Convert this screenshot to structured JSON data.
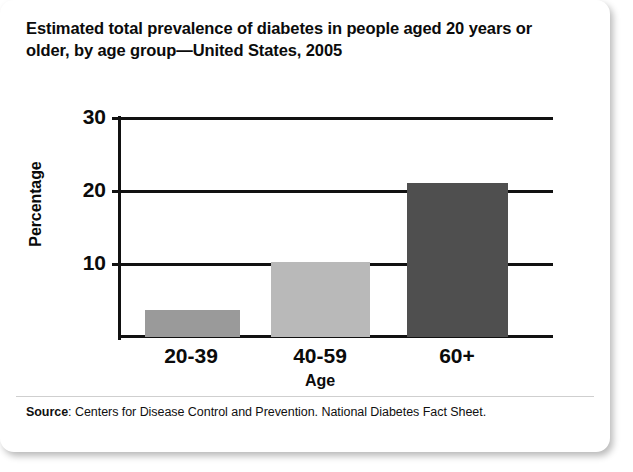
{
  "figure": {
    "title": "Estimated total prevalence of diabetes in people aged 20 years or older, by age group—United States, 2005",
    "source_label": "Source",
    "source_text": ": Centers for Disease Control and Prevention. National Diabetes Fact Sheet."
  },
  "chart_data": {
    "type": "bar",
    "title": "Estimated total prevalence of diabetes in people aged 20 years or older, by age group—United States, 2005",
    "categories": [
      "20-39",
      "40-59",
      "60+"
    ],
    "values": [
      3.6,
      10.1,
      20.6
    ],
    "series": [
      {
        "name": "Estimated total prevalence of diabetes",
        "values": [
          3.6,
          10.1,
          20.6
        ]
      }
    ],
    "xlabel": "Age",
    "ylabel": "Percentage",
    "ylim": [
      0,
      30
    ],
    "yticks": [
      10,
      20,
      30
    ],
    "ytick_labels": [
      "10",
      "20",
      "30"
    ],
    "grid": true,
    "legend": false,
    "bar_colors": [
      "#9a9a9a",
      "#b9b9b9",
      "#4f4f4f"
    ],
    "axis_color": "#111111",
    "background": "#ffffff"
  }
}
